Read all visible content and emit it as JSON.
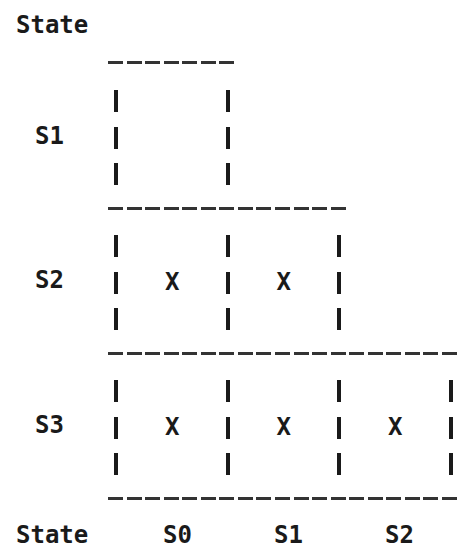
{
  "diagram": {
    "type": "lower-triangular state pair table",
    "axis_title_top": "State",
    "axis_title_bottom": "State",
    "row_states": [
      "S1",
      "S2",
      "S3"
    ],
    "column_states": [
      "S0",
      "S1",
      "S2"
    ],
    "cells": [
      {
        "row": "S1",
        "col": "S0",
        "mark": ""
      },
      {
        "row": "S2",
        "col": "S0",
        "mark": "X"
      },
      {
        "row": "S2",
        "col": "S1",
        "mark": "X"
      },
      {
        "row": "S3",
        "col": "S0",
        "mark": "X"
      },
      {
        "row": "S3",
        "col": "S1",
        "mark": "X"
      },
      {
        "row": "S3",
        "col": "S2",
        "mark": "X"
      }
    ],
    "cells_per_row": [
      1,
      2,
      3
    ]
  }
}
